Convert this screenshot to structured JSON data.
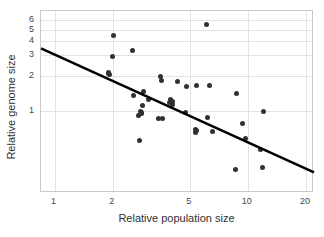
{
  "chart_data": {
    "type": "scatter",
    "title": "",
    "xlabel": "Relative population size",
    "ylabel": "Relative genome size",
    "xscale": "log",
    "yscale": "log",
    "xlim": [
      0.85,
      22
    ],
    "ylim": [
      0.2,
      7.2
    ],
    "grid": true,
    "legend": null,
    "xticks": [
      {
        "value": 1,
        "label": "1"
      },
      {
        "value": 2,
        "label": "2"
      },
      {
        "value": 5,
        "label": "5"
      },
      {
        "value": 10,
        "label": "10"
      },
      {
        "value": 20,
        "label": "20"
      }
    ],
    "yticks": [
      {
        "value": 1,
        "label": "1"
      },
      {
        "value": 2,
        "label": "2"
      },
      {
        "value": 3,
        "label": "3"
      },
      {
        "value": 4,
        "label": "4"
      },
      {
        "value": 5,
        "label": "5"
      },
      {
        "value": 6,
        "label": "6"
      }
    ],
    "marker_color": "#2f3133",
    "marker_size_px": 5,
    "trendline": {
      "type": "linear-on-log-log",
      "color": "#000000",
      "width_px": 2.6,
      "x_start": 0.85,
      "y_start": 3.45,
      "x_end": 22.0,
      "y_end": 0.3
    },
    "points": [
      {
        "x": 1.9,
        "y": 2.15
      },
      {
        "x": 1.92,
        "y": 2.08
      },
      {
        "x": 2.02,
        "y": 4.45
      },
      {
        "x": 2.0,
        "y": 2.95
      },
      {
        "x": 2.52,
        "y": 3.3
      },
      {
        "x": 2.55,
        "y": 1.36
      },
      {
        "x": 2.72,
        "y": 0.92
      },
      {
        "x": 2.78,
        "y": 1.0
      },
      {
        "x": 2.8,
        "y": 0.95
      },
      {
        "x": 2.85,
        "y": 1.12
      },
      {
        "x": 2.88,
        "y": 1.47
      },
      {
        "x": 2.75,
        "y": 0.56
      },
      {
        "x": 3.05,
        "y": 1.25
      },
      {
        "x": 3.55,
        "y": 2.0
      },
      {
        "x": 3.58,
        "y": 1.83
      },
      {
        "x": 3.45,
        "y": 0.87
      },
      {
        "x": 3.6,
        "y": 0.86
      },
      {
        "x": 4.0,
        "y": 1.26
      },
      {
        "x": 4.02,
        "y": 1.18
      },
      {
        "x": 4.05,
        "y": 1.14
      },
      {
        "x": 4.3,
        "y": 1.8
      },
      {
        "x": 4.75,
        "y": 0.97
      },
      {
        "x": 4.8,
        "y": 1.63
      },
      {
        "x": 5.45,
        "y": 1.66
      },
      {
        "x": 5.35,
        "y": 0.7
      },
      {
        "x": 5.38,
        "y": 0.66
      },
      {
        "x": 6.1,
        "y": 5.55
      },
      {
        "x": 6.3,
        "y": 1.66
      },
      {
        "x": 6.2,
        "y": 0.88
      },
      {
        "x": 6.55,
        "y": 0.67
      },
      {
        "x": 8.7,
        "y": 1.43
      },
      {
        "x": 8.6,
        "y": 0.32
      },
      {
        "x": 9.4,
        "y": 0.78
      },
      {
        "x": 9.7,
        "y": 0.58
      },
      {
        "x": 12.0,
        "y": 0.99
      },
      {
        "x": 11.9,
        "y": 0.33
      },
      {
        "x": 11.6,
        "y": 0.47
      },
      {
        "x": 3.95,
        "y": 1.2
      },
      {
        "x": 4.08,
        "y": 1.22
      },
      {
        "x": 5.42,
        "y": 0.68
      },
      {
        "x": 2.82,
        "y": 0.98
      },
      {
        "x": 1.91,
        "y": 2.12
      }
    ]
  }
}
